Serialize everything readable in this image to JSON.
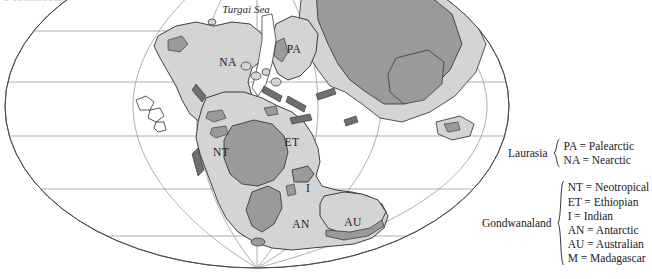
{
  "figure": {
    "type": "paleogeographic-map",
    "projection": "elliptical (Mollweide-style) world projection",
    "clipped_caption_sliver": "a continuous land connection between the northern continents"
  },
  "map": {
    "sea_labels": [
      {
        "name": "turgai-sea",
        "text": "Turgai Sea",
        "x": 246,
        "y": 9
      }
    ],
    "region_labels": [
      {
        "code": "NA",
        "text": "NA",
        "x": 228,
        "y": 62
      },
      {
        "code": "PA",
        "text": "PA",
        "x": 294,
        "y": 49
      },
      {
        "code": "NT",
        "text": "NT",
        "x": 221,
        "y": 152
      },
      {
        "code": "ET",
        "text": "ET",
        "x": 292,
        "y": 142
      },
      {
        "code": "I",
        "text": "I",
        "x": 308,
        "y": 188
      },
      {
        "code": "AN",
        "text": "AN",
        "x": 301,
        "y": 224
      },
      {
        "code": "AU",
        "text": "AU",
        "x": 353,
        "y": 222
      }
    ],
    "colors": {
      "ocean": "#ffffff",
      "land": "#d4d4d4",
      "highland": "#9a9a9a",
      "coastline": "#2b2b2b",
      "graticule": "#8c8c8c",
      "outline": "#4a4a4a"
    }
  },
  "legend": {
    "groups": [
      {
        "name": "laurasia",
        "label": "Laurasia",
        "entries": [
          {
            "code": "PA",
            "text": "PA = Palearctic"
          },
          {
            "code": "NA",
            "text": "NA = Nearctic"
          }
        ]
      },
      {
        "name": "gondwanaland",
        "label": "Gondwanaland",
        "entries": [
          {
            "code": "NT",
            "text": "NT = Neotropical"
          },
          {
            "code": "ET",
            "text": "ET = Ethiopian"
          },
          {
            "code": "I",
            "text": "I = Indian"
          },
          {
            "code": "AN",
            "text": "AN = Antarctic"
          },
          {
            "code": "AU",
            "text": "AU = Australian"
          },
          {
            "code": "M",
            "text": "M = Madagascar"
          }
        ]
      }
    ]
  }
}
